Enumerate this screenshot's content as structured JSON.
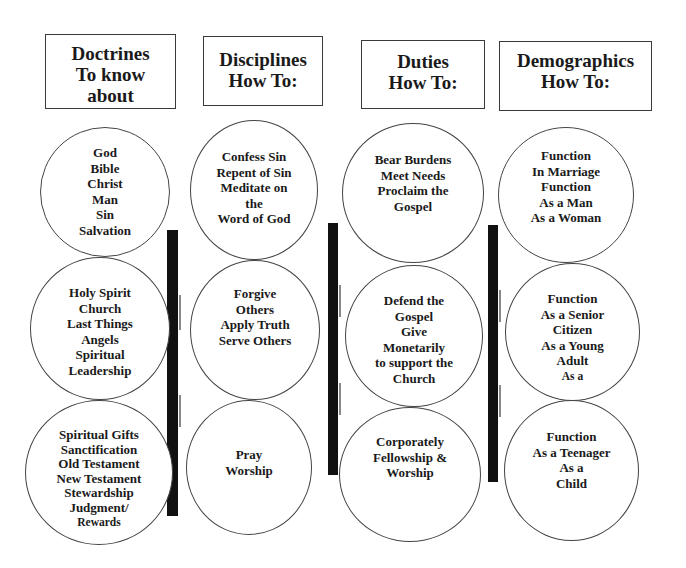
{
  "columns": [
    {
      "header": [
        "Doctrines",
        "To know",
        "about"
      ],
      "circles": [
        [
          "God",
          "Bible",
          "Christ",
          "Man",
          "Sin",
          "Salvation"
        ],
        [
          "Holy Spirit",
          "Church",
          "Last Things",
          "Angels",
          "Spiritual",
          "Leadership"
        ],
        [
          "Spiritual Gifts",
          "Sanctification",
          "Old Testament",
          "New Testament",
          "Stewardship",
          "Judgment/",
          "Rewards"
        ]
      ]
    },
    {
      "header": [
        "Disciplines",
        "How To:"
      ],
      "circles": [
        [
          "Confess Sin",
          "Repent of Sin",
          "Meditate on",
          "the",
          "Word of God"
        ],
        [
          "Forgive",
          "Others",
          "Apply Truth",
          "Serve Others"
        ],
        [
          "Pray",
          "Worship"
        ]
      ]
    },
    {
      "header": [
        "Duties",
        "How To:"
      ],
      "circles": [
        [
          "Bear Burdens",
          "Meet Needs",
          "Proclaim the",
          "Gospel"
        ],
        [
          "Defend the",
          "Gospel",
          "Give",
          "Monetarily",
          "to support the",
          "Church"
        ],
        [
          "Corporately",
          "Fellowship &",
          "Worship"
        ]
      ]
    },
    {
      "header": [
        "Demographics",
        "How To:"
      ],
      "circles": [
        [
          "Function",
          "In Marriage",
          "Function",
          "As a Man",
          "As a Woman"
        ],
        [
          "Function",
          "As a Senior",
          "Citizen",
          "As a Young",
          "Adult",
          "As a"
        ],
        [
          "Function",
          "As a Teenager",
          "As a",
          "Child"
        ]
      ]
    }
  ],
  "colors": {
    "line": "#3a3a3a",
    "bar": "#111111",
    "text": "#1a1a1a",
    "background": "#ffffff"
  }
}
